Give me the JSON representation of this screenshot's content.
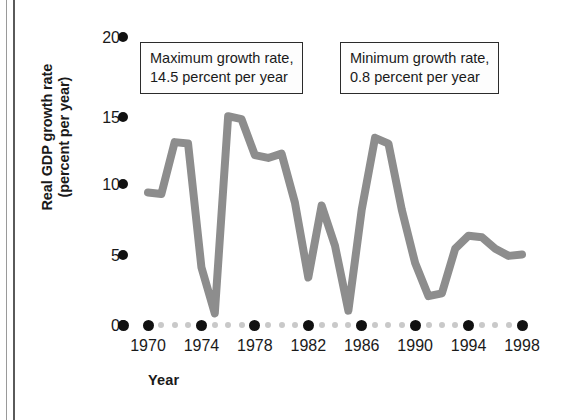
{
  "figure": {
    "y_axis_title_line1": "Real GDP growth rate",
    "y_axis_title_line2": "(percent per year)",
    "x_axis_title": "Year"
  },
  "annotations": [
    {
      "name": "maximum-growth-callout",
      "line1": "Maximum growth rate,",
      "line2": "14.5 percent per year"
    },
    {
      "name": "minimum-growth-callout",
      "line1": "Minimum growth rate,",
      "line2": "0.8 percent per year"
    }
  ],
  "chart_data": {
    "type": "line",
    "title": "",
    "xlabel": "Year",
    "ylabel": "Real GDP growth rate (percent per year)",
    "xlim": [
      1969,
      1998
    ],
    "ylim": [
      0,
      20
    ],
    "yticks": [
      0,
      5,
      10,
      15,
      20
    ],
    "ytick_labels": [
      "0",
      "5",
      "10",
      "15",
      "20"
    ],
    "xticks": [
      1970,
      1974,
      1978,
      1982,
      1986,
      1990,
      1994,
      1998
    ],
    "xtick_labels": [
      "1970",
      "1974",
      "1978",
      "1982",
      "1986",
      "1990",
      "1994",
      "1998"
    ],
    "grid": false,
    "legend": "none",
    "line_color": "#8d8d8d",
    "series": [
      {
        "name": "Real GDP growth rate",
        "x": [
          1970,
          1971,
          1972,
          1973,
          1974,
          1975,
          1976,
          1977,
          1978,
          1979,
          1980,
          1981,
          1982,
          1983,
          1984,
          1985,
          1986,
          1987,
          1988,
          1989,
          1990,
          1991,
          1992,
          1993,
          1994,
          1995,
          1996,
          1997,
          1998
        ],
        "values": [
          9.2,
          9.1,
          12.7,
          12.6,
          4.0,
          0.8,
          14.5,
          14.3,
          11.8,
          11.6,
          11.9,
          8.5,
          3.3,
          8.3,
          5.5,
          1.0,
          8.0,
          13.0,
          12.6,
          8.0,
          4.3,
          2.0,
          2.2,
          5.3,
          6.2,
          6.1,
          5.3,
          4.8,
          4.9
        ]
      }
    ],
    "annotations": [
      {
        "label": "Maximum growth rate",
        "value": 14.5,
        "unit": "percent per year",
        "year": 1976
      },
      {
        "label": "Minimum growth rate",
        "value": 0.8,
        "unit": "percent per year",
        "year": 1975
      }
    ]
  },
  "ytick_positions": [
    {
      "label": "20",
      "label_x": 86,
      "label_y": 30,
      "dot_x": 118,
      "dot_y": 32
    },
    {
      "label": "15",
      "label_x": 86,
      "label_y": 110,
      "dot_x": 118,
      "dot_y": 112
    },
    {
      "label": "10",
      "label_x": 86,
      "label_y": 177,
      "dot_x": 118,
      "dot_y": 179
    },
    {
      "label": "5",
      "label_x": 86,
      "label_y": 248,
      "dot_x": 118,
      "dot_y": 250
    },
    {
      "label": "0",
      "label_x": 86,
      "label_y": 318,
      "dot_x": 118,
      "dot_y": 320
    }
  ]
}
